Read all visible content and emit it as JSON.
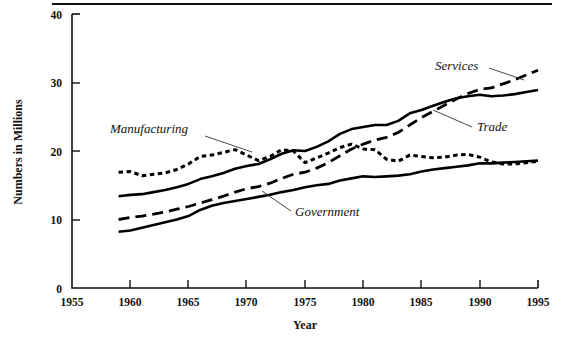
{
  "chart_data": {
    "type": "line",
    "title": "",
    "xlabel": "Year",
    "ylabel": "Numbers in Millions",
    "xlim": [
      1955,
      1995
    ],
    "ylim": [
      0,
      40
    ],
    "xticks": [
      "1955",
      "1960",
      "1965",
      "1970",
      "1975",
      "1980",
      "1985",
      "1990",
      "1995"
    ],
    "yticks": [
      "0",
      "10",
      "20",
      "30",
      "40"
    ],
    "grid": false,
    "legend": "inline-annotations",
    "x": [
      1959,
      1960,
      1961,
      1962,
      1963,
      1964,
      1965,
      1966,
      1967,
      1968,
      1969,
      1970,
      1971,
      1972,
      1973,
      1974,
      1975,
      1976,
      1977,
      1978,
      1979,
      1980,
      1981,
      1982,
      1983,
      1984,
      1985,
      1986,
      1987,
      1988,
      1989,
      1990,
      1991,
      1992,
      1993,
      1994,
      1995
    ],
    "series": [
      {
        "name": "Services",
        "style": "long-dashed",
        "values": [
          10.0,
          10.3,
          10.5,
          10.8,
          11.1,
          11.5,
          11.9,
          12.4,
          12.9,
          13.4,
          14.0,
          14.5,
          14.8,
          15.3,
          16.0,
          16.6,
          16.9,
          17.5,
          18.3,
          19.3,
          20.3,
          21.0,
          21.6,
          22.0,
          22.7,
          23.8,
          24.9,
          25.8,
          26.7,
          27.6,
          28.4,
          29.0,
          29.2,
          29.8,
          30.4,
          31.1,
          31.8
        ]
      },
      {
        "name": "Trade",
        "style": "solid",
        "values": [
          13.4,
          13.6,
          13.7,
          14.0,
          14.3,
          14.7,
          15.2,
          15.9,
          16.3,
          16.8,
          17.4,
          17.8,
          18.1,
          18.8,
          19.6,
          20.1,
          20.0,
          20.6,
          21.4,
          22.5,
          23.2,
          23.5,
          23.8,
          23.8,
          24.4,
          25.5,
          26.0,
          26.6,
          27.2,
          27.7,
          28.0,
          28.2,
          28.0,
          28.1,
          28.3,
          28.6,
          28.9
        ]
      },
      {
        "name": "Manufacturing",
        "style": "dotted",
        "values": [
          16.9,
          17.0,
          16.4,
          16.6,
          16.8,
          17.3,
          18.1,
          19.2,
          19.4,
          19.8,
          20.2,
          19.4,
          18.6,
          19.2,
          20.2,
          20.0,
          18.3,
          19.0,
          19.7,
          20.5,
          21.0,
          20.3,
          20.2,
          18.8,
          18.5,
          19.4,
          19.2,
          19.0,
          19.1,
          19.4,
          19.5,
          19.1,
          18.4,
          18.1,
          18.1,
          18.3,
          18.5
        ]
      },
      {
        "name": "Government",
        "style": "solid",
        "values": [
          8.2,
          8.4,
          8.8,
          9.2,
          9.6,
          10.0,
          10.5,
          11.4,
          12.0,
          12.4,
          12.7,
          13.0,
          13.3,
          13.6,
          14.0,
          14.3,
          14.7,
          15.0,
          15.2,
          15.7,
          16.0,
          16.3,
          16.2,
          16.3,
          16.4,
          16.6,
          17.0,
          17.3,
          17.5,
          17.7,
          17.9,
          18.2,
          18.2,
          18.3,
          18.4,
          18.5,
          18.6
        ]
      }
    ],
    "annotations": [
      {
        "text": "Services",
        "x": 435,
        "y": 70
      },
      {
        "text": "Trade",
        "x": 477,
        "y": 130
      },
      {
        "text": "Manufacturing",
        "x": 110,
        "y": 133
      },
      {
        "text": "Government",
        "x": 295,
        "y": 215
      }
    ],
    "colors": {
      "line": "#000000",
      "text": "#111111",
      "leader": "#333333"
    }
  }
}
